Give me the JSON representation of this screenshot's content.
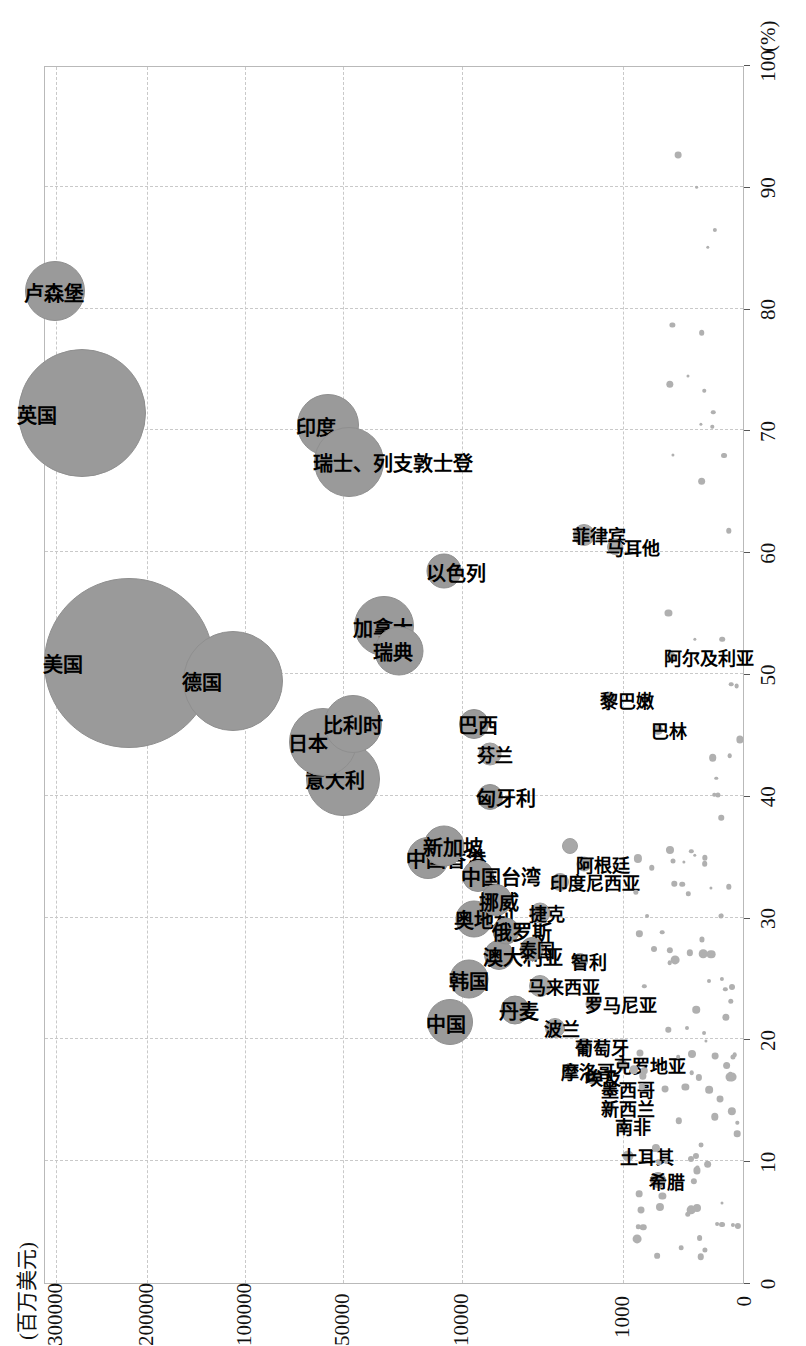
{
  "chart_data": {
    "type": "scatter",
    "title": "",
    "orientation": "rotated-90",
    "ylabel": "(百万美元)",
    "xlabel": "(%)",
    "y_scale": "log-like (uneven tick spacing)",
    "y_ticks": [
      "0",
      "1000",
      "10000",
      "50000",
      "100000",
      "200000",
      "300000"
    ],
    "x_ticks": [
      "0",
      "10",
      "20",
      "30",
      "40",
      "50",
      "60",
      "70",
      "80",
      "90",
      "100"
    ],
    "xlim": [
      0,
      100
    ],
    "grid": true,
    "legend": "none",
    "points": [
      {
        "label": "美国",
        "x": 51.0,
        "y": 215000,
        "size": 168
      },
      {
        "label": "英国",
        "x": 71.5,
        "y": 265000,
        "size": 126
      },
      {
        "label": "德国",
        "x": 49.5,
        "y": 108000,
        "size": 98
      },
      {
        "label": "卢森堡",
        "x": 81.5,
        "y": 300000,
        "size": 58
      },
      {
        "label": "印度",
        "x": 70.5,
        "y": 55000,
        "size": 60
      },
      {
        "label": "瑞士、列支敦士登",
        "x": 67.5,
        "y": 45000,
        "size": 68
      },
      {
        "label": "意大利",
        "x": 41.5,
        "y": 49000,
        "size": 72
      },
      {
        "label": "日本",
        "x": 44.5,
        "y": 57000,
        "size": 66
      },
      {
        "label": "比利时",
        "x": 46.0,
        "y": 43000,
        "size": 56
      },
      {
        "label": "加拿大",
        "x": 54.0,
        "y": 28000,
        "size": 58
      },
      {
        "label": "瑞典",
        "x": 52.0,
        "y": 23000,
        "size": 47
      },
      {
        "label": "以色列",
        "x": 58.5,
        "y": 12500,
        "size": 33
      },
      {
        "label": "中国香港",
        "x": 35.0,
        "y": 15500,
        "size": 40
      },
      {
        "label": "新加坡",
        "x": 36.0,
        "y": 12500,
        "size": 39
      },
      {
        "label": "中国台湾",
        "x": 33.5,
        "y": 7800,
        "size": 30
      },
      {
        "label": "巴西",
        "x": 46.0,
        "y": 8300,
        "size": 28
      },
      {
        "label": "匈牙利",
        "x": 40.0,
        "y": 6600,
        "size": 24
      },
      {
        "label": "芬兰",
        "x": 43.5,
        "y": 6600,
        "size": 21
      },
      {
        "label": "奥地利",
        "x": 30.0,
        "y": 8300,
        "size": 35
      },
      {
        "label": "挪威",
        "x": 31.5,
        "y": 6000,
        "size": 30
      },
      {
        "label": "中国",
        "x": 21.5,
        "y": 11500,
        "size": 44
      },
      {
        "label": "韩国",
        "x": 25.0,
        "y": 8800,
        "size": 37
      },
      {
        "label": "澳大利亚",
        "x": 27.0,
        "y": 5800,
        "size": 28
      },
      {
        "label": "俄罗斯",
        "x": 29.0,
        "y": 5200,
        "size": 25
      },
      {
        "label": "丹麦",
        "x": 22.5,
        "y": 4600,
        "size": 27
      },
      {
        "label": "泰国",
        "x": 27.5,
        "y": 3600,
        "size": 22
      },
      {
        "label": "马来西亚",
        "x": 24.5,
        "y": 3200,
        "size": 20
      },
      {
        "label": "波兰",
        "x": 21.0,
        "y": 2600,
        "size": 18
      },
      {
        "label": "捷克",
        "x": 30.5,
        "y": 3200,
        "size": 19
      },
      {
        "label": "印度尼西亚",
        "x": 33.0,
        "y": 2400,
        "size": 16
      },
      {
        "label": "新加坡2",
        "x": 36.0,
        "y": 2100,
        "size": 14
      },
      {
        "label": "阿根廷",
        "x": 34.5,
        "y": 1700,
        "size": 13
      },
      {
        "label": "智利",
        "x": 26.5,
        "y": 1800,
        "size": 14
      },
      {
        "label": "罗马尼亚",
        "x": 23.0,
        "y": 1500,
        "size": 13
      },
      {
        "label": "葡萄牙",
        "x": 19.5,
        "y": 1700,
        "size": 14
      },
      {
        "label": "埃及",
        "x": 17.0,
        "y": 1500,
        "size": 13
      },
      {
        "label": "墨西哥",
        "x": 16.0,
        "y": 1200,
        "size": 12
      },
      {
        "label": "克罗地亚",
        "x": 18.0,
        "y": 1000,
        "size": 11
      },
      {
        "label": "摩洛哥",
        "x": 17.5,
        "y": 2100,
        "size": 14
      },
      {
        "label": "新西兰",
        "x": 14.5,
        "y": 1200,
        "size": 11
      },
      {
        "label": "南非",
        "x": 13.0,
        "y": 1000,
        "size": 10
      },
      {
        "label": "希腊",
        "x": 8.5,
        "y": 700,
        "size": 14
      },
      {
        "label": "土耳其",
        "x": 10.5,
        "y": 950,
        "size": 11
      },
      {
        "label": "菲律宾",
        "x": 61.5,
        "y": 1700,
        "size": 20
      },
      {
        "label": "马耳他",
        "x": 60.5,
        "y": 1100,
        "size": 14
      },
      {
        "label": "黎巴嫩",
        "x": 48.0,
        "y": 1200,
        "size": 13
      },
      {
        "label": "巴林",
        "x": 45.5,
        "y": 700,
        "size": 10
      },
      {
        "label": "阿尔及利亚",
        "x": 51.5,
        "y": 600,
        "size": 10
      }
    ],
    "unlabeled_points_note": "Numerous small unlabeled markers scattered in the low-value / low-percentage region"
  },
  "axes": {
    "y_title": "(百万美元)",
    "x_title": "(%)",
    "y_ticks": [
      {
        "label": "0",
        "value": 0
      },
      {
        "label": "1000",
        "value": 1000
      },
      {
        "label": "10000",
        "value": 10000
      },
      {
        "label": "50000",
        "value": 50000
      },
      {
        "label": "100000",
        "value": 100000
      },
      {
        "label": "200000",
        "value": 200000
      },
      {
        "label": "300000",
        "value": 300000
      }
    ],
    "x_ticks": [
      {
        "label": "0",
        "value": 0
      },
      {
        "label": "10",
        "value": 10
      },
      {
        "label": "20",
        "value": 20
      },
      {
        "label": "30",
        "value": 30
      },
      {
        "label": "40",
        "value": 40
      },
      {
        "label": "50",
        "value": 50
      },
      {
        "label": "60",
        "value": 60
      },
      {
        "label": "70",
        "value": 70
      },
      {
        "label": "80",
        "value": 80
      },
      {
        "label": "90",
        "value": 90
      },
      {
        "label": "100",
        "value": 100
      }
    ]
  },
  "colors": {
    "bubble_fill": "#9a9a9a",
    "grid": "#c9c9c9",
    "frame": "#b9b9b9",
    "text": "#111111"
  }
}
